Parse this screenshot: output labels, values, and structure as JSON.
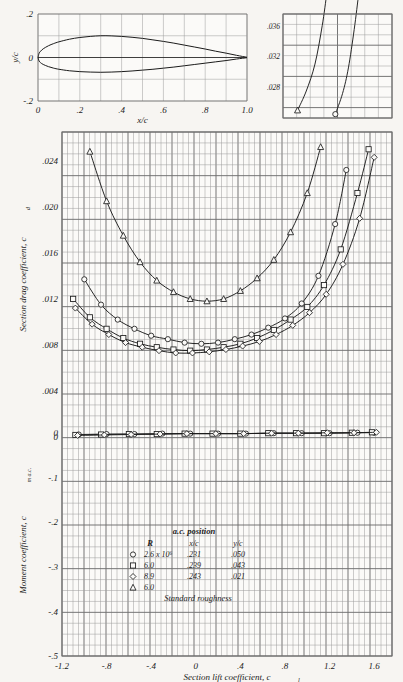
{
  "figure": {
    "background": "#f7f5f2",
    "ink": "#1b1b1b",
    "grid_color": "#6f6f6f",
    "grid_minor_color": "#9a9a9a"
  },
  "profile_plot": {
    "name": "airfoil-profile",
    "xlabel": "x/c",
    "ylabel": "y/c",
    "xticks": [
      "0",
      ".2",
      ".4",
      ".6",
      ".8",
      "1.0"
    ],
    "xtick_values": [
      0,
      0.2,
      0.4,
      0.6,
      0.8,
      1.0
    ],
    "yticks": [
      ".2",
      "0",
      "-.2"
    ],
    "ytick_values": [
      0.2,
      0,
      -0.2
    ],
    "xlim": [
      0,
      1.0
    ],
    "ylim": [
      -0.2,
      0.2
    ],
    "thickness_ratio": 0.12,
    "upper_surface": [
      [
        0.0,
        0.0
      ],
      [
        0.005,
        0.019
      ],
      [
        0.0125,
        0.029
      ],
      [
        0.025,
        0.04
      ],
      [
        0.05,
        0.054
      ],
      [
        0.075,
        0.064
      ],
      [
        0.1,
        0.072
      ],
      [
        0.15,
        0.084
      ],
      [
        0.2,
        0.092
      ],
      [
        0.25,
        0.097
      ],
      [
        0.3,
        0.1
      ],
      [
        0.35,
        0.0995
      ],
      [
        0.4,
        0.097
      ],
      [
        0.45,
        0.093
      ],
      [
        0.5,
        0.088
      ],
      [
        0.55,
        0.081
      ],
      [
        0.6,
        0.074
      ],
      [
        0.65,
        0.066
      ],
      [
        0.7,
        0.057
      ],
      [
        0.75,
        0.048
      ],
      [
        0.8,
        0.039
      ],
      [
        0.85,
        0.029
      ],
      [
        0.9,
        0.02
      ],
      [
        0.95,
        0.01
      ],
      [
        1.0,
        0.001
      ]
    ],
    "lower_surface": [
      [
        0.0,
        0.0
      ],
      [
        0.005,
        -0.016
      ],
      [
        0.0125,
        -0.024
      ],
      [
        0.025,
        -0.032
      ],
      [
        0.05,
        -0.042
      ],
      [
        0.075,
        -0.049
      ],
      [
        0.1,
        -0.054
      ],
      [
        0.15,
        -0.061
      ],
      [
        0.2,
        -0.065
      ],
      [
        0.25,
        -0.067
      ],
      [
        0.3,
        -0.068
      ],
      [
        0.35,
        -0.067
      ],
      [
        0.4,
        -0.065
      ],
      [
        0.45,
        -0.062
      ],
      [
        0.5,
        -0.058
      ],
      [
        0.55,
        -0.054
      ],
      [
        0.6,
        -0.049
      ],
      [
        0.65,
        -0.044
      ],
      [
        0.7,
        -0.038
      ],
      [
        0.75,
        -0.032
      ],
      [
        0.8,
        -0.026
      ],
      [
        0.85,
        -0.02
      ],
      [
        0.9,
        -0.014
      ],
      [
        0.95,
        -0.007
      ],
      [
        1.0,
        -0.001
      ]
    ]
  },
  "inset_plot": {
    "name": "drag-inset",
    "yticks": [
      ".036",
      ".032",
      ".028"
    ],
    "ytick_values": [
      0.036,
      0.032,
      0.028
    ],
    "ylim": [
      0.024,
      0.0375
    ],
    "xlim": [
      1.0,
      1.75
    ],
    "note": "upper continuation of drag curves"
  },
  "chart_data": {
    "type": "line",
    "xlabel": "Section lift coefficient, c_l",
    "ylabel_top": "Section drag coefficient, c_d",
    "ylabel_bottom": "Moment coefficient, c_m a.c.",
    "xlim": [
      -1.2,
      1.76
    ],
    "xticks": [
      "-1.2",
      "-.8",
      "-.4",
      "0",
      ".4",
      ".8",
      "1.2",
      "1.6"
    ],
    "xtick_values": [
      -1.2,
      -0.8,
      -0.4,
      0,
      0.4,
      0.8,
      1.2,
      1.6
    ],
    "drag_ylim": [
      0,
      0.0265
    ],
    "drag_yticks": [
      ".024",
      ".020",
      ".016",
      ".012",
      ".008",
      ".004",
      "0"
    ],
    "drag_ytick_values": [
      0.024,
      0.02,
      0.016,
      0.012,
      0.008,
      0.004,
      0
    ],
    "moment_ylim": [
      -0.5,
      0.033
    ],
    "moment_yticks": [
      "0",
      "-.1",
      "-.2",
      "-.3",
      "-.4",
      "-.5"
    ],
    "moment_ytick_values": [
      0,
      -0.1,
      -0.2,
      -0.3,
      -0.4,
      -0.5
    ],
    "grid": true,
    "legend_position": "lower-center",
    "series": [
      {
        "name": "R = 2.6 x 10^6",
        "marker": "circle",
        "drag": [
          [
            -1.0,
            0.0137
          ],
          [
            -0.85,
            0.0115
          ],
          [
            -0.7,
            0.0102
          ],
          [
            -0.55,
            0.0094
          ],
          [
            -0.4,
            0.0088
          ],
          [
            -0.25,
            0.0085
          ],
          [
            -0.1,
            0.0082
          ],
          [
            0.05,
            0.0081
          ],
          [
            0.2,
            0.0082
          ],
          [
            0.35,
            0.0085
          ],
          [
            0.5,
            0.0089
          ],
          [
            0.65,
            0.0095
          ],
          [
            0.8,
            0.0103
          ],
          [
            0.95,
            0.0116
          ],
          [
            1.1,
            0.014
          ],
          [
            1.25,
            0.0185
          ],
          [
            1.35,
            0.0232
          ],
          [
            1.42,
            0.0295
          ]
        ],
        "moment": [
          [
            -1.05,
            -0.004
          ],
          [
            -0.8,
            -0.003
          ],
          [
            -0.55,
            -0.003
          ],
          [
            -0.3,
            -0.002
          ],
          [
            -0.05,
            -0.002
          ],
          [
            0.2,
            -0.002
          ],
          [
            0.45,
            -0.002
          ],
          [
            0.7,
            -0.001
          ],
          [
            0.95,
            -0.001
          ],
          [
            1.2,
            -0.001
          ],
          [
            1.45,
            0.0
          ],
          [
            1.6,
            0.0
          ]
        ]
      },
      {
        "name": "R = 6.0 x 10^6",
        "marker": "square",
        "drag": [
          [
            -1.1,
            0.012
          ],
          [
            -0.95,
            0.0104
          ],
          [
            -0.8,
            0.0094
          ],
          [
            -0.65,
            0.0086
          ],
          [
            -0.5,
            0.0081
          ],
          [
            -0.35,
            0.0078
          ],
          [
            -0.2,
            0.0076
          ],
          [
            -0.05,
            0.0075
          ],
          [
            0.1,
            0.0076
          ],
          [
            0.25,
            0.0078
          ],
          [
            0.4,
            0.0081
          ],
          [
            0.55,
            0.0086
          ],
          [
            0.7,
            0.0093
          ],
          [
            0.85,
            0.0102
          ],
          [
            1.0,
            0.0113
          ],
          [
            1.15,
            0.0132
          ],
          [
            1.3,
            0.0163
          ],
          [
            1.45,
            0.0212
          ],
          [
            1.55,
            0.025
          ]
        ],
        "moment": [
          [
            -1.08,
            -0.005
          ],
          [
            -0.85,
            -0.004
          ],
          [
            -0.6,
            -0.003
          ],
          [
            -0.35,
            -0.003
          ],
          [
            -0.1,
            -0.002
          ],
          [
            0.15,
            -0.002
          ],
          [
            0.4,
            -0.002
          ],
          [
            0.65,
            -0.001
          ],
          [
            0.9,
            -0.001
          ],
          [
            1.15,
            -0.001
          ],
          [
            1.4,
            0.0
          ],
          [
            1.58,
            0.001
          ]
        ]
      },
      {
        "name": "R = 8.9 x 10^6",
        "marker": "diamond",
        "drag": [
          [
            -1.08,
            0.0112
          ],
          [
            -0.93,
            0.0098
          ],
          [
            -0.78,
            0.0089
          ],
          [
            -0.63,
            0.0082
          ],
          [
            -0.48,
            0.0078
          ],
          [
            -0.33,
            0.0075
          ],
          [
            -0.18,
            0.0073
          ],
          [
            -0.03,
            0.0073
          ],
          [
            0.12,
            0.0074
          ],
          [
            0.27,
            0.0076
          ],
          [
            0.42,
            0.0079
          ],
          [
            0.57,
            0.0083
          ],
          [
            0.72,
            0.0089
          ],
          [
            0.87,
            0.0097
          ],
          [
            1.02,
            0.0108
          ],
          [
            1.17,
            0.0124
          ],
          [
            1.32,
            0.015
          ],
          [
            1.47,
            0.019
          ],
          [
            1.6,
            0.0243
          ]
        ],
        "moment": [
          [
            -1.06,
            -0.006
          ],
          [
            -0.82,
            -0.005
          ],
          [
            -0.58,
            -0.004
          ],
          [
            -0.32,
            -0.003
          ],
          [
            -0.08,
            -0.002
          ],
          [
            0.18,
            -0.002
          ],
          [
            0.43,
            -0.002
          ],
          [
            0.68,
            -0.001
          ],
          [
            0.92,
            -0.001
          ],
          [
            1.18,
            0.0
          ],
          [
            1.42,
            0.0
          ],
          [
            1.62,
            0.001
          ]
        ]
      },
      {
        "name": "R = 6.0 x 10^6, standard roughness",
        "marker": "triangle",
        "drag": [
          [
            -0.95,
            0.0248
          ],
          [
            -0.8,
            0.0205
          ],
          [
            -0.65,
            0.0175
          ],
          [
            -0.5,
            0.0152
          ],
          [
            -0.35,
            0.0136
          ],
          [
            -0.2,
            0.0126
          ],
          [
            -0.05,
            0.012
          ],
          [
            0.1,
            0.0118
          ],
          [
            0.25,
            0.012
          ],
          [
            0.4,
            0.0127
          ],
          [
            0.55,
            0.0138
          ],
          [
            0.7,
            0.0154
          ],
          [
            0.85,
            0.0178
          ],
          [
            1.0,
            0.0212
          ],
          [
            1.12,
            0.0252
          ],
          [
            1.22,
            0.03
          ]
        ],
        "moment": []
      }
    ],
    "legend": {
      "title": "a.c. position",
      "columns": [
        "R",
        "x/c",
        "y/c"
      ],
      "rows": [
        {
          "marker": "circle",
          "R": "2.6 x 10⁶",
          "xc": ".231",
          "yc": ".050"
        },
        {
          "marker": "square",
          "R": "6.0",
          "xc": ".239",
          "yc": ".043"
        },
        {
          "marker": "diamond",
          "R": "8.9",
          "xc": ".243",
          "yc": ".021"
        },
        {
          "marker": "triangle",
          "R": "6.0",
          "xc": "",
          "yc": ""
        }
      ],
      "footnote": "Standard roughness"
    }
  }
}
